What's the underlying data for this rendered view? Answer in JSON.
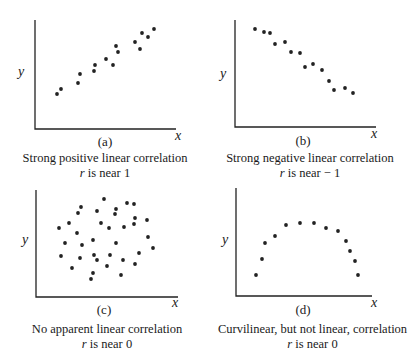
{
  "chart_data": [
    {
      "type": "scatter",
      "panel": "(a)",
      "xlabel": "x",
      "ylabel": "y",
      "caption": "Strong positive linear correlation",
      "subcaption_var": "r",
      "subcaption_text": " is near 1",
      "points": [
        [
          57,
          94
        ],
        [
          61,
          89
        ],
        [
          78,
          83
        ],
        [
          80,
          74
        ],
        [
          94,
          71
        ],
        [
          95,
          65
        ],
        [
          106,
          59
        ],
        [
          113,
          65
        ],
        [
          116,
          46
        ],
        [
          118,
          52
        ],
        [
          135,
          42
        ],
        [
          140,
          49
        ],
        [
          142,
          33
        ],
        [
          148,
          37
        ],
        [
          154,
          29
        ]
      ]
    },
    {
      "type": "scatter",
      "panel": "(b)",
      "xlabel": "x",
      "ylabel": "y",
      "caption": "Strong negative linear correlation",
      "subcaption_var": "r",
      "subcaption_text": " is near − 1",
      "points": [
        [
          255,
          29
        ],
        [
          264,
          32
        ],
        [
          270,
          33
        ],
        [
          275,
          44
        ],
        [
          285,
          42
        ],
        [
          291,
          52
        ],
        [
          300,
          53
        ],
        [
          305,
          67
        ],
        [
          313,
          64
        ],
        [
          322,
          70
        ],
        [
          329,
          81
        ],
        [
          334,
          90
        ],
        [
          345,
          88
        ],
        [
          353,
          93
        ]
      ]
    },
    {
      "type": "scatter",
      "panel": "(c)",
      "xlabel": "x",
      "ylabel": "y",
      "caption": "No apparent linear correlation",
      "subcaption_var": "r",
      "subcaption_text": " is near 0",
      "points": [
        [
          104,
          199
        ],
        [
          81,
          207
        ],
        [
          78,
          213
        ],
        [
          97,
          211
        ],
        [
          116,
          209
        ],
        [
          115,
          214
        ],
        [
          127,
          203
        ],
        [
          134,
          204
        ],
        [
          135,
          218
        ],
        [
          134,
          224
        ],
        [
          147,
          220
        ],
        [
          69,
          223
        ],
        [
          59,
          228
        ],
        [
          101,
          223
        ],
        [
          109,
          228
        ],
        [
          124,
          227
        ],
        [
          77,
          233
        ],
        [
          65,
          243
        ],
        [
          93,
          240
        ],
        [
          116,
          243
        ],
        [
          148,
          237
        ],
        [
          153,
          248
        ],
        [
          82,
          245
        ],
        [
          61,
          256
        ],
        [
          80,
          258
        ],
        [
          94,
          255
        ],
        [
          97,
          260
        ],
        [
          110,
          255
        ],
        [
          123,
          260
        ],
        [
          139,
          253
        ],
        [
          135,
          264
        ],
        [
          72,
          268
        ],
        [
          107,
          266
        ],
        [
          93,
          273
        ],
        [
          91,
          279
        ],
        [
          121,
          275
        ]
      ]
    },
    {
      "type": "scatter",
      "panel": "(d)",
      "xlabel": "x",
      "ylabel": "y",
      "caption": "Curvilinear, but not linear, correlation",
      "subcaption_var": "r",
      "subcaption_text": " is near 0",
      "points": [
        [
          256,
          275
        ],
        [
          262,
          259
        ],
        [
          265,
          243
        ],
        [
          275,
          236
        ],
        [
          286,
          225
        ],
        [
          300,
          223
        ],
        [
          314,
          223
        ],
        [
          326,
          228
        ],
        [
          338,
          231
        ],
        [
          346,
          241
        ],
        [
          350,
          251
        ],
        [
          355,
          261
        ],
        [
          358,
          275
        ]
      ]
    }
  ]
}
